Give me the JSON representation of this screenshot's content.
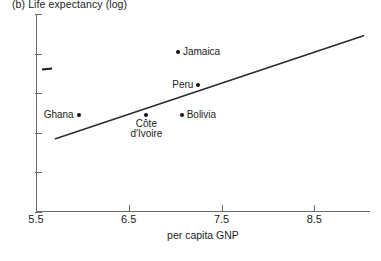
{
  "figure": {
    "panel_title": "(b)  Life expectancy (log)",
    "x_axis_title": "per capita GNP",
    "background_color": "#ffffff",
    "axis_color": "#6b6b6b",
    "text_color": "#1c1c1c",
    "marker_color": "#111111",
    "line_color": "#2b2b2b"
  },
  "chart_data": {
    "type": "scatter",
    "title": "(b)  Life expectancy (log)",
    "xlabel": "per capita GNP",
    "ylabel": "",
    "xlim": [
      5.5,
      9.1
    ],
    "ylim": [
      3.5,
      4.5
    ],
    "xticks": [
      5.5,
      6.5,
      7.5,
      8.5
    ],
    "xtick_labels": [
      "5.5",
      "6.5",
      "7.5",
      "8.5"
    ],
    "yticks": [
      3.5,
      3.7,
      3.9,
      4.1,
      4.3,
      4.5
    ],
    "ytick_labels": [
      "3.5",
      "3.7",
      "3.9",
      "4.1",
      "4.3",
      "4.5"
    ],
    "grid": false,
    "legend": false,
    "points": [
      {
        "label": "Ghana",
        "x": 5.96,
        "y": 3.99,
        "label_position": "left"
      },
      {
        "label": "Côte\nd'Ivoire",
        "x": 6.69,
        "y": 3.99,
        "label_position": "below"
      },
      {
        "label": "Bolivia",
        "x": 7.07,
        "y": 3.99,
        "label_position": "right"
      },
      {
        "label": "Jamaica",
        "x": 7.03,
        "y": 4.31,
        "label_position": "right"
      },
      {
        "label": "Peru",
        "x": 7.25,
        "y": 4.14,
        "label_position": "left"
      }
    ],
    "fit_line": {
      "type": "linear",
      "x0": 5.71,
      "y0": 3.87,
      "x1": 9.03,
      "y1": 4.39
    }
  }
}
